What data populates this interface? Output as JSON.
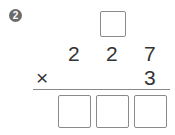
{
  "problem": {
    "number": "2",
    "multiplicand": [
      "2",
      "2",
      "7"
    ],
    "operator": "×",
    "multiplier": "3",
    "carry_boxes": [
      ""
    ],
    "answer_boxes": [
      "",
      "",
      ""
    ]
  }
}
